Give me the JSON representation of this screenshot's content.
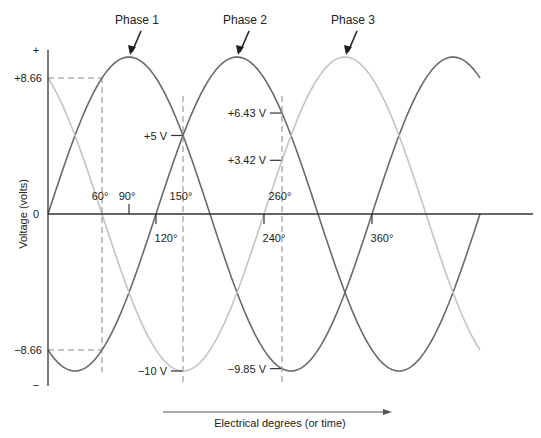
{
  "chart_data": {
    "type": "line",
    "title": "",
    "xlabel": "Electrical degrees (or time)",
    "ylabel": "Voltage (volts)",
    "x_range_degrees": [
      0,
      480
    ],
    "amplitude_volts": 10,
    "y_axis_top_label": "+",
    "y_axis_bottom_label": "−",
    "y_zero_label": "0",
    "series": [
      {
        "name": "Phase 1",
        "phase_shift_degrees": 0,
        "color": "#6a6a6a",
        "peak_label_at_degrees": 90
      },
      {
        "name": "Phase 2",
        "phase_shift_degrees": 120,
        "color": "#6a6a6a",
        "peak_label_at_degrees": 210
      },
      {
        "name": "Phase 3",
        "phase_shift_degrees": 240,
        "color": "#c4c4c4",
        "peak_label_at_degrees": 330
      }
    ],
    "angle_markers": [
      {
        "label": "60°",
        "degrees": 60,
        "dashed": true,
        "side": "above"
      },
      {
        "label": "90°",
        "degrees": 90,
        "dashed": false,
        "side": "above"
      },
      {
        "label": "120°",
        "degrees": 120,
        "dashed": false,
        "side": "below"
      },
      {
        "label": "150°",
        "degrees": 150,
        "dashed": true,
        "side": "above"
      },
      {
        "label": "240°",
        "degrees": 240,
        "dashed": false,
        "side": "below"
      },
      {
        "label": "260°",
        "degrees": 260,
        "dashed": true,
        "side": "above"
      },
      {
        "label": "360°",
        "degrees": 360,
        "dashed": false,
        "side": "below"
      }
    ],
    "axis_value_labels": [
      {
        "label": "+8.66",
        "volts": 8.66
      },
      {
        "label": "−8.66",
        "volts": -8.66
      }
    ],
    "point_annotations": [
      {
        "label": "+5 V",
        "degrees": 150,
        "volts": 5
      },
      {
        "label": "−10 V",
        "degrees": 150,
        "volts": -10
      },
      {
        "label": "+6.43 V",
        "degrees": 260,
        "volts": 6.43
      },
      {
        "label": "+3.42 V",
        "degrees": 260,
        "volts": 3.42
      },
      {
        "label": "−9.85 V",
        "degrees": 260,
        "volts": -9.85
      }
    ]
  }
}
